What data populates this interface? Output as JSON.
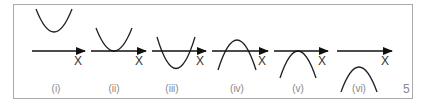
{
  "figure": {
    "border_color": "#aaaaaa",
    "curve_color": "#222222",
    "label_color": "#888888",
    "page_number": "5",
    "panels": [
      {
        "label": "(i)",
        "axis_label": "X",
        "shape": "upward parabola entirely above x-axis (no real roots)"
      },
      {
        "label": "(ii)",
        "axis_label": "X",
        "shape": "upward parabola touching x-axis (one repeated root)"
      },
      {
        "label": "(iii)",
        "axis_label": "X",
        "shape": "upward parabola crossing x-axis (two real roots)"
      },
      {
        "label": "(iv)",
        "axis_label": "X",
        "shape": "downward parabola crossing x-axis (two real roots)"
      },
      {
        "label": "(v)",
        "axis_label": "X",
        "shape": "downward parabola touching x-axis (one repeated root)"
      },
      {
        "label": "(vi)",
        "axis_label": "X",
        "shape": "downward parabola entirely below x-axis (no real roots)"
      }
    ]
  }
}
